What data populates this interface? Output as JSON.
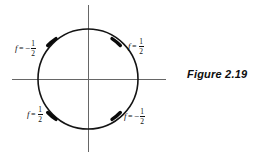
{
  "figure": {
    "caption": "Figure 2.19",
    "background_color": "#ffffff",
    "stroke_color": "#111111",
    "axis_color": "#555555"
  },
  "diagram": {
    "type": "unit-circle-with-marked-points",
    "circle": {
      "cx": 88,
      "cy": 79,
      "r": 50
    },
    "axes": {
      "horizontal": {
        "x1": 12,
        "y1": 79,
        "x2": 166,
        "y2": 79
      },
      "vertical": {
        "x1": 88,
        "y1": 5,
        "x2": 88,
        "y2": 152
      }
    },
    "markers": [
      {
        "name": "marker-upper-left",
        "angle_deg": 135,
        "label_ref": 0
      },
      {
        "name": "marker-upper-right",
        "angle_deg": 45,
        "label_ref": 1
      },
      {
        "name": "marker-lower-left",
        "angle_deg": 225,
        "label_ref": 2
      },
      {
        "name": "marker-lower-right",
        "angle_deg": 315,
        "label_ref": 3
      }
    ]
  },
  "labels": [
    {
      "id": "upper-left",
      "variable": "f",
      "equals": "=",
      "sign": "−",
      "numerator": "1",
      "denominator": "2",
      "text": "f = -1/2"
    },
    {
      "id": "upper-right",
      "variable": "f",
      "equals": "=",
      "sign": "",
      "numerator": "1",
      "denominator": "2",
      "text": "f = 1/2"
    },
    {
      "id": "lower-left",
      "variable": "f",
      "equals": "=",
      "sign": "",
      "numerator": "1",
      "denominator": "2",
      "text": "f = 1/2"
    },
    {
      "id": "lower-right",
      "variable": "f",
      "equals": "=",
      "sign": "−",
      "numerator": "1",
      "denominator": "2",
      "text": "f = -1/2"
    }
  ]
}
